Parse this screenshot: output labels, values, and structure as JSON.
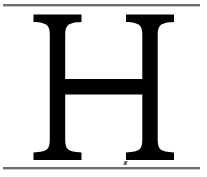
{
  "page": {
    "kind": "scanned-page-fragment",
    "width": 207,
    "height": 177,
    "background_color": "#ffffff"
  },
  "glyph": {
    "character": "H",
    "name": "capital-letter-h",
    "style": "serif",
    "color": "#000000",
    "left_px": 33,
    "right_px": 174,
    "top_px": 14,
    "bottom_px": 160
  },
  "rules": {
    "color": "#6e6e6e",
    "shadow_color": "#c9c9c9",
    "top_label": "top-rule",
    "bottom_label": "bottom-rule",
    "left_px": 3,
    "width_px": 197,
    "top_y_px": 4,
    "bottom_y_px": 167
  },
  "artifact": {
    "name": "scan-speck",
    "color": "#4a4a4a",
    "x_px": 124,
    "y_px": 161
  }
}
